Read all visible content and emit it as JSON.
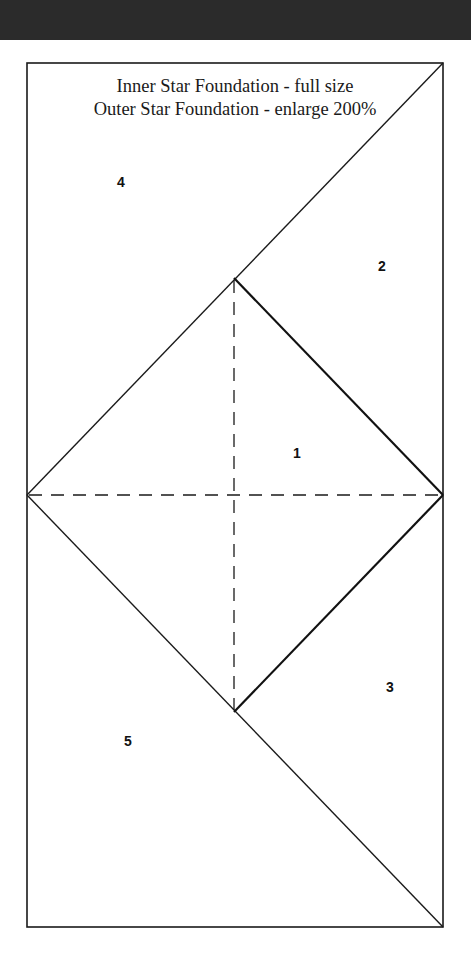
{
  "header": {
    "band_color": "#2b2b2b"
  },
  "title": {
    "line1": "Inner Star Foundation - full size",
    "line2": "Outer Star Foundation - enlarge 200%"
  },
  "pattern": {
    "outline_color": "#1a1a1a",
    "pieces": [
      {
        "id": "4",
        "label": "4",
        "x": 121,
        "y": 182
      },
      {
        "id": "2",
        "label": "2",
        "x": 382,
        "y": 266
      },
      {
        "id": "1",
        "label": "1",
        "x": 297,
        "y": 453
      },
      {
        "id": "3",
        "label": "3",
        "x": 390,
        "y": 687
      },
      {
        "id": "5",
        "label": "5",
        "x": 128,
        "y": 741
      }
    ]
  }
}
